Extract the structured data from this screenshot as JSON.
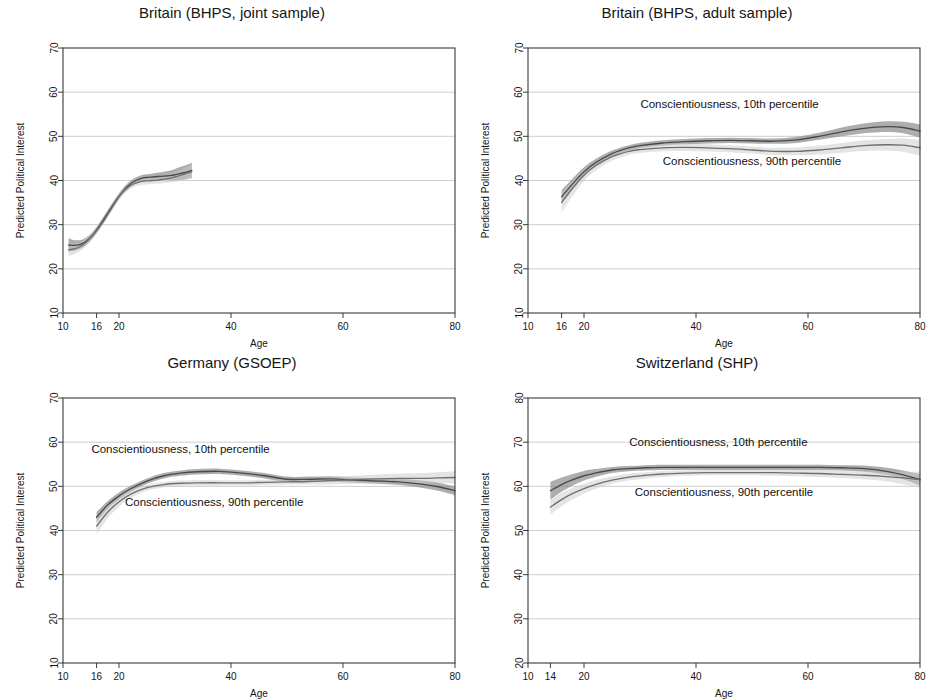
{
  "figure": {
    "axis_label_x": "Age",
    "axis_label_y": "Predicted Political Interest",
    "legend_low": "Conscientiousness, 10th percentile",
    "legend_high": "Conscientiousness, 90th percentile",
    "colors": {
      "line_low": "#4a4a4a",
      "line_high": "#6f6f6f",
      "band_low": "#8d8d8d",
      "band_high": "#c9c9c9",
      "grid": "#b9b9b9",
      "frame": "#3a3a3a",
      "background": "#ffffff"
    }
  },
  "chart_data": [
    {
      "type": "line",
      "panel": "top-left",
      "title": "Britain (BHPS, joint sample)",
      "xlabel": "Age",
      "ylabel": "Predicted Political Interest",
      "xlim": [
        10,
        80
      ],
      "ylim": [
        10,
        70
      ],
      "xticks": [
        10,
        16,
        20,
        40,
        60,
        80
      ],
      "yticks": [
        10,
        20,
        30,
        40,
        50,
        60,
        70
      ],
      "grid": true,
      "annotations": [],
      "x": [
        11,
        12,
        13,
        14,
        15,
        16,
        17,
        18,
        19,
        20,
        21,
        22,
        23,
        24,
        25,
        26,
        27,
        28,
        29,
        30,
        31,
        32,
        33
      ],
      "series": [
        {
          "name": "Conscientiousness, 10th percentile",
          "values": [
            25.4,
            25.3,
            25.5,
            26.1,
            27.2,
            28.7,
            30.5,
            32.5,
            34.5,
            36.4,
            38.0,
            39.2,
            40.0,
            40.5,
            40.7,
            40.8,
            40.9,
            41.0,
            41.1,
            41.3,
            41.6,
            41.9,
            42.3
          ],
          "ci_low": [
            23.9,
            24.1,
            24.5,
            25.2,
            26.4,
            28.0,
            29.8,
            31.8,
            33.8,
            35.7,
            37.3,
            38.5,
            39.3,
            39.8,
            40.0,
            40.0,
            40.0,
            40.0,
            40.0,
            40.0,
            40.1,
            40.3,
            40.6
          ],
          "ci_high": [
            26.9,
            26.5,
            26.5,
            27.0,
            28.0,
            29.4,
            31.2,
            33.2,
            35.2,
            37.1,
            38.7,
            39.9,
            40.7,
            41.2,
            41.4,
            41.6,
            41.8,
            42.0,
            42.2,
            42.6,
            43.1,
            43.5,
            44.0
          ]
        },
        {
          "name": "Conscientiousness, 90th percentile",
          "values": [
            24.3,
            24.5,
            25.0,
            25.9,
            27.2,
            28.9,
            30.8,
            32.8,
            34.7,
            36.4,
            37.8,
            38.8,
            39.4,
            39.8,
            39.9,
            40.0,
            40.1,
            40.3,
            40.5,
            40.8,
            41.2,
            41.6,
            42.0
          ],
          "ci_low": [
            22.9,
            23.3,
            24.0,
            25.0,
            26.4,
            28.2,
            30.1,
            32.1,
            34.0,
            35.7,
            37.1,
            38.1,
            38.7,
            39.0,
            39.1,
            39.2,
            39.3,
            39.4,
            39.5,
            39.7,
            40.0,
            40.2,
            40.4
          ],
          "ci_high": [
            25.7,
            25.7,
            26.0,
            26.8,
            28.0,
            29.6,
            31.5,
            33.5,
            35.4,
            37.1,
            38.5,
            39.5,
            40.1,
            40.6,
            40.7,
            40.8,
            40.9,
            41.2,
            41.5,
            41.9,
            42.4,
            43.0,
            43.6
          ]
        }
      ]
    },
    {
      "type": "line",
      "panel": "top-right",
      "title": "Britain (BHPS, adult sample)",
      "xlabel": "Age",
      "ylabel": "Predicted Political Interest",
      "xlim": [
        10,
        80
      ],
      "ylim": [
        10,
        70
      ],
      "xticks": [
        10,
        16,
        20,
        40,
        60,
        80
      ],
      "yticks": [
        10,
        20,
        30,
        40,
        50,
        60,
        70
      ],
      "grid": true,
      "annotations": [
        {
          "text": "Conscientiousness, 10th percentile",
          "x": 46,
          "y": 56.5
        },
        {
          "text": "Conscientiousness, 90th percentile",
          "x": 50,
          "y": 43.5
        }
      ],
      "x": [
        16,
        18,
        20,
        22,
        25,
        28,
        30,
        34,
        38,
        42,
        46,
        50,
        54,
        58,
        62,
        66,
        70,
        74,
        77,
        80
      ],
      "series": [
        {
          "name": "Conscientiousness, 10th percentile",
          "values": [
            36.3,
            39.3,
            42.0,
            44.0,
            46.1,
            47.4,
            47.9,
            48.5,
            48.8,
            49.0,
            49.1,
            49.0,
            48.9,
            49.2,
            50.0,
            51.0,
            51.8,
            52.2,
            52.0,
            51.2
          ],
          "ci_low": [
            34.8,
            38.1,
            41.0,
            43.2,
            45.4,
            46.8,
            47.3,
            47.9,
            48.2,
            48.4,
            48.5,
            48.4,
            48.3,
            48.5,
            49.2,
            50.0,
            50.7,
            51.0,
            50.7,
            49.7
          ],
          "ci_high": [
            37.8,
            40.5,
            43.0,
            44.8,
            46.8,
            48.0,
            48.5,
            49.1,
            49.4,
            49.6,
            49.7,
            49.6,
            49.5,
            49.9,
            50.8,
            52.0,
            52.9,
            53.4,
            53.3,
            52.7
          ]
        },
        {
          "name": "Conscientiousness, 90th percentile",
          "values": [
            35.0,
            38.3,
            41.2,
            43.3,
            45.4,
            46.6,
            47.0,
            47.4,
            47.5,
            47.4,
            47.2,
            46.9,
            46.6,
            46.6,
            46.9,
            47.4,
            47.9,
            48.1,
            48.0,
            47.4
          ],
          "ci_low": [
            32.8,
            36.6,
            39.9,
            42.2,
            44.5,
            45.8,
            46.2,
            46.6,
            46.7,
            46.6,
            46.4,
            46.1,
            45.8,
            45.7,
            45.9,
            46.3,
            46.7,
            46.8,
            46.5,
            45.6
          ],
          "ci_high": [
            37.2,
            40.0,
            42.5,
            44.4,
            46.3,
            47.4,
            47.8,
            48.2,
            48.3,
            48.2,
            48.0,
            47.7,
            47.4,
            47.5,
            47.9,
            48.5,
            49.1,
            49.4,
            49.5,
            49.2
          ]
        }
      ]
    },
    {
      "type": "line",
      "panel": "bottom-left",
      "title": "Germany (GSOEP)",
      "xlabel": "Age",
      "ylabel": "Predicted Political Interest",
      "xlim": [
        10,
        80
      ],
      "ylim": [
        10,
        70
      ],
      "xticks": [
        10,
        16,
        20,
        40,
        60,
        80
      ],
      "yticks": [
        10,
        20,
        30,
        40,
        50,
        60,
        70
      ],
      "grid": true,
      "annotations": [
        {
          "text": "Conscientiousness, 10th percentile",
          "x": 31,
          "y": 57.5
        },
        {
          "text": "Conscientiousness, 90th percentile",
          "x": 37,
          "y": 45.5
        }
      ],
      "x": [
        16,
        18,
        20,
        22,
        25,
        28,
        31,
        34,
        38,
        42,
        46,
        50,
        54,
        58,
        62,
        66,
        70,
        74,
        77,
        80
      ],
      "series": [
        {
          "name": "Conscientiousness, 10th percentile",
          "values": [
            43.0,
            45.8,
            47.8,
            49.4,
            51.2,
            52.4,
            53.0,
            53.3,
            53.4,
            53.0,
            52.4,
            51.6,
            51.6,
            51.7,
            51.4,
            51.2,
            51.0,
            50.5,
            49.9,
            49.0
          ],
          "ci_low": [
            41.8,
            44.9,
            47.0,
            48.7,
            50.6,
            51.8,
            52.4,
            52.7,
            52.8,
            52.4,
            51.8,
            51.0,
            51.0,
            51.1,
            50.8,
            50.6,
            50.3,
            49.7,
            49.0,
            48.0
          ],
          "ci_high": [
            44.2,
            46.7,
            48.6,
            50.1,
            51.8,
            53.0,
            53.6,
            53.9,
            54.0,
            53.6,
            53.0,
            52.2,
            52.2,
            52.3,
            52.0,
            51.8,
            51.7,
            51.3,
            50.8,
            50.0
          ]
        },
        {
          "name": "Conscientiousness, 90th percentile",
          "values": [
            41.0,
            44.2,
            46.5,
            48.2,
            49.7,
            50.4,
            50.7,
            50.8,
            50.8,
            50.8,
            50.9,
            51.0,
            51.1,
            51.3,
            51.5,
            51.7,
            51.8,
            51.8,
            51.9,
            52.0
          ],
          "ci_low": [
            39.2,
            42.8,
            45.4,
            47.3,
            49.0,
            49.8,
            50.1,
            50.2,
            50.2,
            50.2,
            50.3,
            50.4,
            50.4,
            50.5,
            50.6,
            50.7,
            50.8,
            50.7,
            50.7,
            50.6
          ],
          "ci_high": [
            42.8,
            45.6,
            47.6,
            49.1,
            50.4,
            51.0,
            51.3,
            51.4,
            51.4,
            51.4,
            51.5,
            51.6,
            51.8,
            52.1,
            52.4,
            52.7,
            52.9,
            53.0,
            53.2,
            53.4
          ]
        }
      ]
    },
    {
      "type": "line",
      "panel": "bottom-right",
      "title": "Switzerland (SHP)",
      "xlabel": "Age",
      "ylabel": "Predicted Political Interest",
      "xlim": [
        10,
        80
      ],
      "ylim": [
        20,
        80
      ],
      "xticks": [
        10,
        14,
        20,
        40,
        60,
        80
      ],
      "yticks": [
        20,
        30,
        40,
        50,
        60,
        70,
        80
      ],
      "grid": true,
      "annotations": [
        {
          "text": "Conscientiousness, 10th percentile",
          "x": 44,
          "y": 69.2
        },
        {
          "text": "Conscientiousness, 90th percentile",
          "x": 45,
          "y": 57.8
        }
      ],
      "x": [
        14,
        16,
        18,
        20,
        22,
        25,
        28,
        31,
        34,
        38,
        42,
        46,
        50,
        54,
        58,
        62,
        66,
        70,
        74,
        77,
        80
      ],
      "series": [
        {
          "name": "Conscientiousness, 10th percentile",
          "values": [
            59.0,
            60.4,
            61.5,
            62.4,
            63.0,
            63.7,
            64.0,
            64.2,
            64.3,
            64.3,
            64.3,
            64.3,
            64.3,
            64.3,
            64.3,
            64.3,
            64.2,
            64.0,
            63.4,
            62.6,
            61.5
          ],
          "ci_low": [
            57.0,
            58.8,
            60.2,
            61.3,
            62.1,
            63.0,
            63.4,
            63.6,
            63.7,
            63.7,
            63.7,
            63.7,
            63.7,
            63.7,
            63.7,
            63.7,
            63.6,
            63.3,
            62.6,
            61.6,
            60.2
          ],
          "ci_high": [
            61.0,
            62.0,
            62.8,
            63.5,
            63.9,
            64.4,
            64.6,
            64.8,
            64.9,
            64.9,
            64.9,
            64.9,
            64.9,
            64.9,
            64.9,
            64.9,
            64.8,
            64.7,
            64.2,
            63.6,
            62.8
          ]
        },
        {
          "name": "Conscientiousness, 90th percentile",
          "values": [
            55.3,
            57.0,
            58.4,
            59.5,
            60.4,
            61.4,
            62.1,
            62.5,
            62.8,
            63.0,
            63.1,
            63.1,
            63.1,
            63.1,
            63.0,
            62.9,
            62.7,
            62.5,
            62.2,
            61.9,
            61.5
          ],
          "ci_low": [
            53.6,
            55.5,
            57.1,
            58.4,
            59.4,
            60.6,
            61.3,
            61.8,
            62.1,
            62.4,
            62.5,
            62.5,
            62.5,
            62.4,
            62.3,
            62.1,
            61.9,
            61.6,
            61.1,
            60.5,
            59.7
          ],
          "ci_high": [
            57.0,
            58.5,
            59.7,
            60.6,
            61.4,
            62.2,
            62.9,
            63.2,
            63.5,
            63.6,
            63.7,
            63.7,
            63.7,
            63.8,
            63.7,
            63.7,
            63.5,
            63.4,
            63.3,
            63.3,
            63.3
          ]
        }
      ]
    }
  ]
}
